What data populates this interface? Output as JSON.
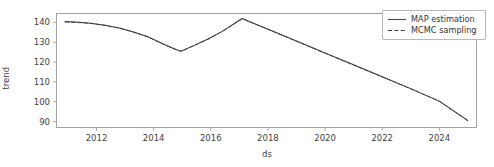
{
  "chart_data": {
    "type": "line",
    "title": "",
    "xlabel": "ds",
    "ylabel": "trend",
    "xlim": [
      2010.6,
      2025.3
    ],
    "ylim": [
      87.0,
      144.5
    ],
    "xticks": [
      "2012",
      "2014",
      "2016",
      "2018",
      "2020",
      "2022",
      "2024"
    ],
    "xtick_values": [
      2012,
      2014,
      2016,
      2018,
      2020,
      2022,
      2024
    ],
    "yticks": [
      "90",
      "100",
      "110",
      "120",
      "130",
      "140"
    ],
    "ytick_values": [
      90,
      100,
      110,
      120,
      130,
      140
    ],
    "grid": false,
    "legend_position": "upper right",
    "series": [
      {
        "name": "MAP estimation",
        "style": "solid",
        "color": "#4a4a4a",
        "x": [
          2010.9,
          2011.3,
          2011.8,
          2012.3,
          2012.8,
          2013.3,
          2013.8,
          2014.3,
          2014.7,
          2014.95,
          2015.4,
          2015.9,
          2016.4,
          2016.8,
          2017.1,
          2017.6,
          2018.2,
          2019.0,
          2020.0,
          2021.0,
          2022.0,
          2023.0,
          2024.0,
          2025.0
        ],
        "y": [
          140.5,
          140.2,
          139.6,
          138.6,
          137.2,
          135.2,
          132.8,
          129.4,
          126.8,
          125.5,
          128.3,
          131.6,
          135.5,
          139.2,
          142.0,
          139.0,
          135.4,
          130.6,
          124.6,
          118.6,
          112.6,
          106.6,
          100.3,
          90.5
        ]
      },
      {
        "name": "MCMC sampling",
        "style": "dashed",
        "color": "#3c3c3c",
        "x": [
          2010.9,
          2011.3,
          2011.8,
          2012.3,
          2012.8,
          2013.3,
          2013.8,
          2014.3,
          2014.7,
          2014.95,
          2015.4,
          2015.9,
          2016.4,
          2016.8,
          2017.1,
          2017.6,
          2018.2,
          2019.0,
          2020.0,
          2021.0,
          2022.0,
          2023.0,
          2024.0,
          2025.0
        ],
        "y": [
          140.2,
          140.0,
          139.5,
          138.5,
          137.1,
          135.1,
          132.7,
          129.3,
          126.7,
          125.4,
          128.2,
          131.5,
          135.4,
          139.1,
          141.9,
          138.9,
          135.3,
          130.5,
          124.5,
          118.5,
          112.5,
          106.5,
          100.2,
          90.4
        ]
      }
    ]
  },
  "legend": {
    "items": [
      {
        "label": "MAP estimation",
        "style": "solid"
      },
      {
        "label": "MCMC sampling",
        "style": "dashed"
      }
    ]
  },
  "axes": {
    "xlabel": "ds",
    "ylabel": "trend"
  },
  "colors": {
    "line": "#4a4a4a",
    "axis": "#8a8a8a",
    "text": "#3f3f3f",
    "legend_border": "#b8b8b8",
    "background": "#ffffff"
  }
}
